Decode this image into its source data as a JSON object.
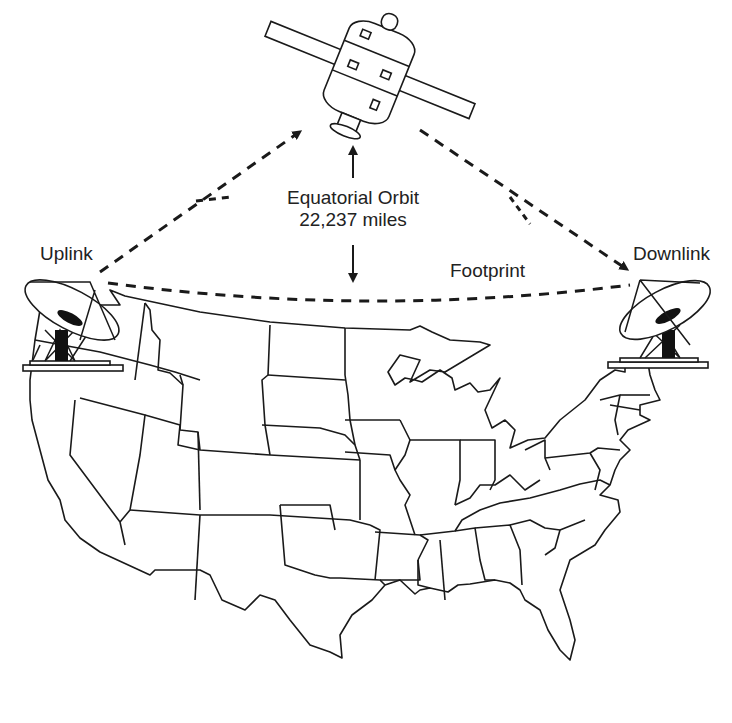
{
  "diagram": {
    "labels": {
      "orbit_line1": "Equatorial Orbit",
      "orbit_line2": "22,237 miles",
      "uplink": "Uplink",
      "downlink": "Downlink",
      "footprint": "Footprint"
    },
    "elements": [
      {
        "id": "satellite",
        "icon": "satellite-icon"
      },
      {
        "id": "uplink-dish",
        "icon": "satellite-dish-icon"
      },
      {
        "id": "downlink-dish",
        "icon": "satellite-dish-icon"
      },
      {
        "id": "us-map",
        "icon": "map-outline"
      }
    ],
    "colors": {
      "ink": "#1a1a1a",
      "background": "#ffffff"
    }
  }
}
